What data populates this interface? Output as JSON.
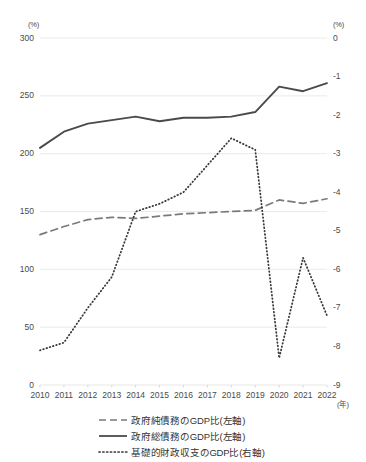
{
  "chart_data": {
    "type": "line",
    "title": "",
    "xlabel": "(年)",
    "ylabel_left": "(%)",
    "ylabel_right": "(%)",
    "categories": [
      "2010",
      "2011",
      "2012",
      "2013",
      "2014",
      "2015",
      "2016",
      "2017",
      "2018",
      "2019",
      "2020",
      "2021",
      "2022"
    ],
    "ylim_left": [
      0,
      300
    ],
    "ylim_right": [
      -9,
      0
    ],
    "yticks_left": [
      "300",
      "250",
      "200",
      "150",
      "100",
      "50",
      "0"
    ],
    "yticks_right": [
      "0",
      "-1",
      "-2",
      "-3",
      "-4",
      "-5",
      "-6",
      "-7",
      "-8",
      "-9"
    ],
    "grid": true,
    "legend_position": "bottom",
    "series": [
      {
        "name": "政府純債務のGDP比(左軸)",
        "axis": "left",
        "style": "dashed",
        "color": "#7a7a7a",
        "values": [
          130,
          137,
          143,
          145,
          144,
          146,
          148,
          149,
          150,
          151,
          160,
          157,
          161
        ]
      },
      {
        "name": "政府総債務のGDP比(左軸)",
        "axis": "left",
        "style": "solid",
        "color": "#4a4a4a",
        "values": [
          205,
          219,
          226,
          229,
          232,
          228,
          231,
          231,
          232,
          236,
          258,
          254,
          261
        ]
      },
      {
        "name": "基礎的財政収支のGDP比(右軸)",
        "axis": "right",
        "style": "dotted",
        "color": "#3a3a3a",
        "values": [
          -8.1,
          -7.9,
          -7.0,
          -6.2,
          -4.5,
          -4.3,
          -4.0,
          -3.3,
          -2.6,
          -2.9,
          -8.3,
          -5.7,
          -7.2
        ]
      }
    ]
  },
  "axes": {
    "left_unit": "(%)",
    "right_unit": "(%)",
    "x_unit": "(年)"
  },
  "legend": {
    "items": [
      {
        "label": "政府純債務のGDP比(左軸)",
        "style": "dashed"
      },
      {
        "label": "政府総債務のGDP比(左軸)",
        "style": "solid"
      },
      {
        "label": "基礎的財政収支のGDP比(右軸)",
        "style": "dotted"
      }
    ]
  }
}
